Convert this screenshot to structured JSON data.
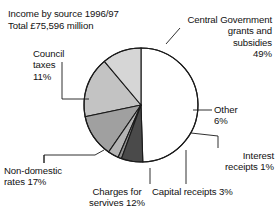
{
  "chart_data": {
    "type": "pie",
    "title_line1": "Income by source 1996/97",
    "title_line2": "Total £75,596 million",
    "xlabel": "",
    "ylabel": "",
    "grid": false,
    "legend_position": "callout-labels",
    "units": "percent of total income",
    "total": "£75,596 million",
    "period": "1996/97",
    "categories": [
      "Central Government grants and subsidies",
      "Other",
      "Interest receipts",
      "Capital receipts",
      "Charges for servives",
      "Non-domestic rates",
      "Council taxes"
    ],
    "values": [
      49,
      6,
      1,
      3,
      12,
      17,
      11
    ],
    "colors": [
      "#ffffff",
      "#4a4a4a",
      "#8f8f8f",
      "#b4b4b4",
      "#a0a0a0",
      "#c3c3c3",
      "#d6d6d6"
    ],
    "slices": [
      {
        "label": "Central Government grants and subsidies",
        "value": 49,
        "value_text": "49%",
        "color": "#ffffff"
      },
      {
        "label": "Other",
        "value": 6,
        "value_text": "6%",
        "color": "#4a4a4a"
      },
      {
        "label": "Interest receipts",
        "value": 1,
        "value_text": "1%",
        "color": "#8f8f8f"
      },
      {
        "label": "Capital receipts",
        "value": 3,
        "value_text": "3%",
        "color": "#b4b4b4"
      },
      {
        "label": "Charges for servives",
        "value": 12,
        "value_text": "12%",
        "color": "#a0a0a0"
      },
      {
        "label": "Non-domestic rates",
        "value": 17,
        "value_text": "17%",
        "color": "#c3c3c3"
      },
      {
        "label": "Council taxes",
        "value": 11,
        "value_text": "11%",
        "color": "#d6d6d6"
      }
    ]
  },
  "labels": {
    "central": "Central Government\ngrants and\nsubsidies\n49%",
    "council": "Council\ntaxes\n11%",
    "other": "Other\n6%",
    "interest": "Interest\nreceipts 1%",
    "capital": "Capital receipts 3%",
    "charges": "Charges for\nservives 12%",
    "nondomestic": "Non-domestic\nrates 17%"
  },
  "style": {
    "stroke": "#1a1a1a",
    "background": "#ffffff"
  }
}
